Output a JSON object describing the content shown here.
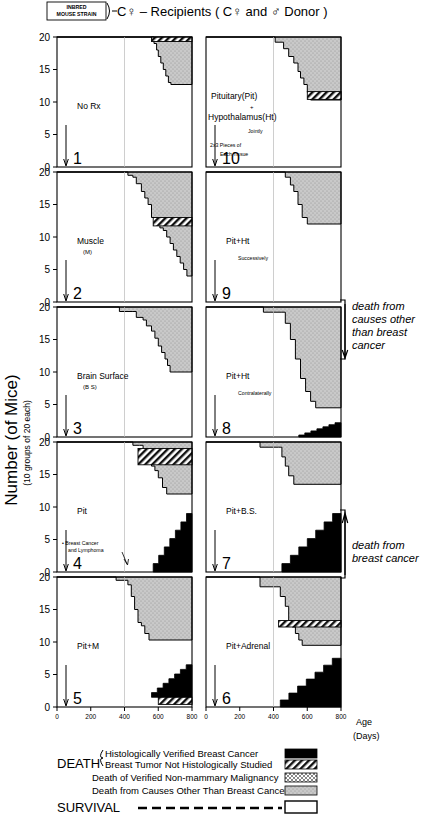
{
  "figure": {
    "title": "C♀ – Recipients  ( C♀ and ♂ Donor )",
    "strain_box_line1": "INBRED",
    "strain_box_line2": "MOUSE STRAIN",
    "y_axis_label": "Number (of Mice)",
    "y_axis_sublabel": "(10 groups of 20 each)",
    "x_axis_label": "Age",
    "x_axis_sublabel": "(Days)",
    "y_ticks": [
      "20",
      "15",
      "10",
      "5",
      "0"
    ],
    "x_ticks": [
      "0",
      "200",
      "400",
      "600",
      "800"
    ],
    "y_range": [
      0,
      20
    ],
    "x_range": [
      0,
      800
    ]
  },
  "annotations": [
    {
      "name": "death-other-causes",
      "lines": [
        "death from",
        "causes other",
        "than breast",
        "cancer"
      ]
    },
    {
      "name": "death-breast-cancer",
      "lines": [
        "death from",
        "breast cancer"
      ]
    }
  ],
  "legend": {
    "death_label": "DEATH",
    "survival_label": "SURVIVAL",
    "items": [
      {
        "label": "Histologically Verified Breast Cancer",
        "swatch": "solid-black"
      },
      {
        "label": "Breast Tumor Not Histologically Studied",
        "swatch": "hatch-diagonal"
      },
      {
        "label": "Death of Verified Non-mammary Malignancy",
        "swatch": "fine-crosshatch"
      },
      {
        "label": "Death from Causes Other Than Breast Cancer",
        "swatch": "gray-stipple"
      },
      {
        "label": "SURVIVAL",
        "swatch": "white-open"
      }
    ]
  },
  "panels": [
    {
      "number": "1",
      "label": "No Rx",
      "sublabel": "",
      "sublabel2": "",
      "note": "",
      "col": "left",
      "row": 0,
      "chart_data": {
        "type": "area",
        "survival_steps": [
          [
            0,
            20
          ],
          [
            560,
            20
          ],
          [
            575,
            19
          ],
          [
            590,
            18
          ],
          [
            600,
            17
          ],
          [
            615,
            16
          ],
          [
            630,
            15
          ],
          [
            645,
            14
          ],
          [
            660,
            13
          ],
          [
            675,
            12.7
          ],
          [
            800,
            12.7
          ]
        ],
        "bands": [
          {
            "category": "death-other-causes",
            "from_x": 560,
            "to_x": 800,
            "style": "gray-stipple"
          },
          {
            "category": "breast-tumor-not-studied",
            "from_x": 560,
            "to_x": 800,
            "style": "hatch",
            "top": 20,
            "bottom": 19.3
          }
        ]
      }
    },
    {
      "number": "2",
      "label": "Muscle",
      "sublabel": "(M)",
      "sublabel2": "",
      "note": "",
      "col": "left",
      "row": 1,
      "chart_data": {
        "type": "area",
        "survival_steps": [
          [
            0,
            20
          ],
          [
            400,
            20
          ],
          [
            420,
            19.5
          ],
          [
            450,
            19.2
          ],
          [
            470,
            18.2
          ],
          [
            500,
            17
          ],
          [
            520,
            16
          ],
          [
            540,
            15
          ],
          [
            560,
            13
          ],
          [
            590,
            12
          ],
          [
            610,
            11.4
          ],
          [
            630,
            11
          ],
          [
            650,
            10
          ],
          [
            670,
            9
          ],
          [
            690,
            8
          ],
          [
            710,
            7
          ],
          [
            730,
            6
          ],
          [
            750,
            5
          ],
          [
            770,
            4
          ],
          [
            800,
            4
          ]
        ],
        "bands": [
          {
            "category": "breast-tumor-not-studied",
            "from_x": 570,
            "to_x": 800,
            "style": "hatch",
            "top": 13,
            "bottom": 11.7
          }
        ]
      }
    },
    {
      "number": "3",
      "label": "Brain Surface",
      "sublabel": "(B S)",
      "sublabel2": "",
      "note": "",
      "col": "left",
      "row": 2,
      "chart_data": {
        "type": "area",
        "survival_steps": [
          [
            0,
            20
          ],
          [
            350,
            20
          ],
          [
            370,
            19.3
          ],
          [
            450,
            19.3
          ],
          [
            470,
            18.4
          ],
          [
            510,
            18
          ],
          [
            530,
            17.1
          ],
          [
            560,
            16.3
          ],
          [
            580,
            15.2
          ],
          [
            600,
            14
          ],
          [
            620,
            13
          ],
          [
            640,
            12
          ],
          [
            655,
            11
          ],
          [
            670,
            10
          ],
          [
            800,
            10
          ]
        ],
        "bands": []
      }
    },
    {
      "number": "4",
      "label": "Pit",
      "sublabel": "",
      "sublabel2": "",
      "note": "• Breast Cancer and Lymphoma",
      "col": "left",
      "row": 3,
      "chart_data": {
        "type": "area",
        "survival_steps": [
          [
            0,
            20
          ],
          [
            430,
            20
          ],
          [
            450,
            19.5
          ],
          [
            490,
            19.5
          ],
          [
            510,
            18.5
          ],
          [
            540,
            17.7
          ],
          [
            560,
            16.3
          ],
          [
            580,
            15.6
          ],
          [
            600,
            14.5
          ],
          [
            625,
            13
          ],
          [
            650,
            12
          ],
          [
            800,
            12
          ]
        ],
        "bands": [
          {
            "category": "breast-cancer-verified",
            "from_x": 570,
            "to_x": 800,
            "style": "black",
            "top": 9,
            "bottom": 0
          },
          {
            "category": "breast-tumor-not-studied",
            "from_x": 480,
            "to_x": 800,
            "style": "hatch",
            "top": 19,
            "bottom": 16.5
          }
        ]
      }
    },
    {
      "number": "5",
      "label": "Pit+M",
      "sublabel": "",
      "sublabel2": "",
      "note": "",
      "col": "left",
      "row": 4,
      "chart_data": {
        "type": "area",
        "survival_steps": [
          [
            0,
            20
          ],
          [
            330,
            20
          ],
          [
            350,
            19.5
          ],
          [
            400,
            19.5
          ],
          [
            420,
            18.8
          ],
          [
            440,
            17
          ],
          [
            460,
            15
          ],
          [
            480,
            13
          ],
          [
            500,
            12.5
          ],
          [
            520,
            11.3
          ],
          [
            545,
            10.3
          ],
          [
            800,
            10.3
          ]
        ],
        "bands": [
          {
            "category": "breast-cancer-verified",
            "from_x": 560,
            "to_x": 800,
            "style": "black",
            "top": 6.5,
            "bottom": 1.5
          },
          {
            "category": "breast-tumor-not-studied",
            "from_x": 600,
            "to_x": 800,
            "style": "hatch",
            "top": 1.5,
            "bottom": 0.4
          }
        ]
      }
    },
    {
      "number": "10",
      "label": "Pituitary(Pit)",
      "label2": "+",
      "label3": "Hypothalamus(Ht)",
      "sublabel": "Jointly",
      "sublabel2": "2x3 Pieces of Each Tissue",
      "note": "",
      "col": "right",
      "row": 0,
      "chart_data": {
        "type": "area",
        "survival_steps": [
          [
            0,
            20
          ],
          [
            390,
            20
          ],
          [
            410,
            19.2
          ],
          [
            460,
            18.2
          ],
          [
            490,
            17
          ],
          [
            520,
            16
          ],
          [
            545,
            14.7
          ],
          [
            560,
            13.7
          ],
          [
            580,
            12.7
          ],
          [
            600,
            11.5
          ],
          [
            620,
            10.3
          ],
          [
            800,
            10.3
          ]
        ],
        "bands": [
          {
            "category": "breast-tumor-not-studied",
            "from_x": 600,
            "to_x": 800,
            "style": "hatch",
            "top": 11.6,
            "bottom": 10.4
          }
        ]
      }
    },
    {
      "number": "9",
      "label": "Pit+Ht",
      "sublabel": "Successively",
      "sublabel2": "",
      "note": "",
      "col": "right",
      "row": 1,
      "chart_data": {
        "type": "area",
        "survival_steps": [
          [
            0,
            20
          ],
          [
            450,
            20
          ],
          [
            470,
            19.2
          ],
          [
            500,
            18
          ],
          [
            520,
            17
          ],
          [
            545,
            15
          ],
          [
            570,
            13
          ],
          [
            600,
            12
          ],
          [
            800,
            12
          ]
        ],
        "bands": []
      }
    },
    {
      "number": "8",
      "label": "Pit+Ht",
      "sublabel": "Contralaterally",
      "sublabel2": "",
      "note": "",
      "col": "right",
      "row": 2,
      "chart_data": {
        "type": "area",
        "survival_steps": [
          [
            0,
            20
          ],
          [
            320,
            20
          ],
          [
            340,
            19.2
          ],
          [
            450,
            19.2
          ],
          [
            470,
            17.5
          ],
          [
            500,
            15
          ],
          [
            530,
            12
          ],
          [
            560,
            9
          ],
          [
            590,
            7
          ],
          [
            620,
            5.5
          ],
          [
            650,
            4.5
          ],
          [
            800,
            4.5
          ]
        ],
        "bands": [
          {
            "category": "breast-cancer-verified",
            "from_x": 550,
            "to_x": 800,
            "style": "black",
            "top": 2.2,
            "bottom": 0
          }
        ]
      }
    },
    {
      "number": "7",
      "label": "Pit+B.S.",
      "sublabel": "",
      "sublabel2": "",
      "note": "",
      "col": "right",
      "row": 3,
      "chart_data": {
        "type": "area",
        "survival_steps": [
          [
            0,
            20
          ],
          [
            300,
            20
          ],
          [
            320,
            19.2
          ],
          [
            430,
            19.2
          ],
          [
            450,
            17.7
          ],
          [
            470,
            16.3
          ],
          [
            490,
            14.8
          ],
          [
            520,
            13.5
          ],
          [
            800,
            13.5
          ]
        ],
        "bands": [
          {
            "category": "breast-cancer-verified",
            "from_x": 450,
            "to_x": 800,
            "style": "black",
            "top": 9,
            "bottom": 0
          }
        ]
      }
    },
    {
      "number": "6",
      "label": "Pit+Adrenal",
      "sublabel": "",
      "sublabel2": "",
      "note": "",
      "col": "right",
      "row": 4,
      "chart_data": {
        "type": "area",
        "survival_steps": [
          [
            0,
            20
          ],
          [
            300,
            20
          ],
          [
            320,
            18.5
          ],
          [
            420,
            18.5
          ],
          [
            440,
            17
          ],
          [
            470,
            15.5
          ],
          [
            490,
            13.3
          ],
          [
            510,
            12.3
          ],
          [
            530,
            11.3
          ],
          [
            550,
            10.3
          ],
          [
            570,
            9.5
          ],
          [
            800,
            9.5
          ]
        ],
        "bands": [
          {
            "category": "breast-cancer-verified",
            "from_x": 440,
            "to_x": 800,
            "style": "black",
            "top": 7.5,
            "bottom": 0
          },
          {
            "category": "breast-tumor-not-studied",
            "from_x": 430,
            "to_x": 800,
            "style": "hatch",
            "top": 13.3,
            "bottom": 12.3
          }
        ]
      }
    }
  ]
}
